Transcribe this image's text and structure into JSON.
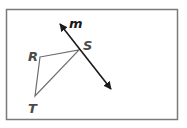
{
  "figure": {
    "frame": {
      "x": 6,
      "y": 9,
      "width": 171,
      "height": 110,
      "stroke": "#7a7a7a"
    },
    "triangle": {
      "stroke": "#6e6e6e",
      "vertices": {
        "R": {
          "x": 40,
          "y": 57,
          "label": "R",
          "label_x": 28,
          "label_y": 61
        },
        "S": {
          "x": 79,
          "y": 50,
          "label": "S",
          "label_x": 83,
          "label_y": 50
        },
        "T": {
          "x": 35,
          "y": 96,
          "label": "T",
          "label_x": 28,
          "label_y": 113
        }
      }
    },
    "line_m": {
      "label": "m",
      "start": {
        "x": 60,
        "y": 24
      },
      "end": {
        "x": 111,
        "y": 89
      },
      "label_x": 69,
      "label_y": 28,
      "stroke": "#1a1a1a"
    }
  }
}
